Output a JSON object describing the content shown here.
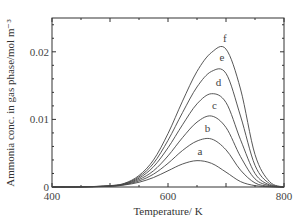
{
  "chart_data": {
    "type": "line",
    "title": "",
    "xlabel": "Temperature/ K",
    "ylabel": "Ammonia conc. in gas phase/mol m⁻³",
    "xlim": [
      400,
      800
    ],
    "ylim": [
      0,
      0.025
    ],
    "x_ticks": [
      400,
      600,
      800
    ],
    "x_tick_labels": [
      "400",
      "600",
      "800"
    ],
    "y_ticks": [
      0,
      0.01,
      0.02
    ],
    "y_tick_labels": [
      "0",
      "0.01",
      "0.02"
    ],
    "grid": false,
    "legend": "inline labels near peaks",
    "x": [
      400,
      450,
      500,
      525,
      550,
      575,
      600,
      625,
      650,
      675,
      700,
      725,
      750,
      775,
      800
    ],
    "series": [
      {
        "name": "a",
        "values": [
          0,
          2e-05,
          0.0001,
          0.0003,
          0.0007,
          0.0014,
          0.0024,
          0.0034,
          0.0039,
          0.0035,
          0.0022,
          0.0008,
          0.0002,
          3e-05,
          0
        ]
      },
      {
        "name": "b",
        "values": [
          0,
          2e-05,
          0.00012,
          0.00035,
          0.0009,
          0.0019,
          0.0035,
          0.0054,
          0.0068,
          0.0071,
          0.0055,
          0.0025,
          0.0006,
          0.0001,
          0
        ]
      },
      {
        "name": "c",
        "values": [
          0,
          2e-05,
          0.00014,
          0.0004,
          0.0011,
          0.0024,
          0.0046,
          0.0073,
          0.0096,
          0.0105,
          0.0088,
          0.0045,
          0.0012,
          0.0002,
          0
        ]
      },
      {
        "name": "d",
        "values": [
          0,
          2e-05,
          0.00016,
          0.00045,
          0.0013,
          0.003,
          0.0058,
          0.0092,
          0.0123,
          0.0138,
          0.0125,
          0.007,
          0.002,
          0.0003,
          0
        ]
      },
      {
        "name": "e",
        "values": [
          0,
          2e-05,
          0.00018,
          0.0005,
          0.0015,
          0.0035,
          0.0069,
          0.011,
          0.0148,
          0.0171,
          0.0168,
          0.0105,
          0.0032,
          0.0005,
          0
        ]
      },
      {
        "name": "f",
        "values": [
          0,
          2e-05,
          0.0002,
          0.00055,
          0.0017,
          0.004,
          0.0079,
          0.0127,
          0.0171,
          0.0199,
          0.0204,
          0.0145,
          0.0048,
          0.0008,
          0
        ]
      }
    ],
    "peak_labels": [
      {
        "label": "a",
        "x": 655,
        "y": 0.0044
      },
      {
        "label": "b",
        "x": 668,
        "y": 0.0078
      },
      {
        "label": "c",
        "x": 680,
        "y": 0.0113
      },
      {
        "label": "d",
        "x": 687,
        "y": 0.0146
      },
      {
        "label": "e",
        "x": 693,
        "y": 0.0183
      },
      {
        "label": "f",
        "x": 698,
        "y": 0.0212
      }
    ]
  }
}
